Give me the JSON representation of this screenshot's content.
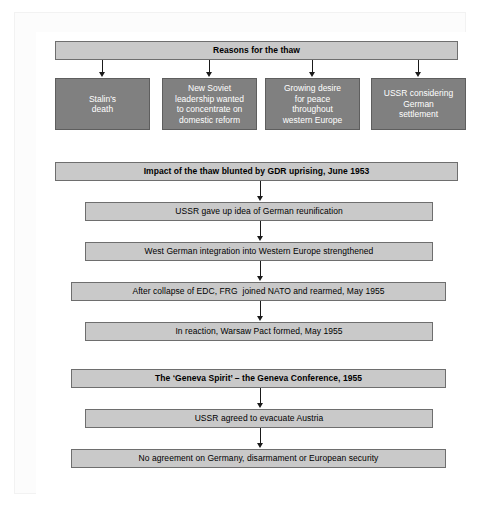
{
  "diagram": {
    "title_bar": {
      "label": "Reasons for the thaw"
    },
    "reasons": [
      {
        "label": "Stalin's\ndeath"
      },
      {
        "label": "New Soviet\nleadership wanted\nto concentrate on\ndomestic reform"
      },
      {
        "label": "Growing desire\nfor peace\nthroughout\nwestern Europe"
      },
      {
        "label": "USSR considering\nGerman\nsettlement"
      }
    ],
    "impact_header": {
      "label": "Impact of the thaw blunted by GDR uprising, June 1953"
    },
    "impact_steps": [
      {
        "label": "USSR gave up idea of German reunification"
      },
      {
        "label": "West German integration into Western Europe strengthened"
      },
      {
        "label": "After collapse of EDC, FRG  joined NATO and rearmed, May 1955"
      },
      {
        "label": "In reaction, Warsaw Pact formed, May 1955"
      }
    ],
    "geneva_header": {
      "label": "The ‘Geneva Spirit’ – the Geneva Conference, 1955"
    },
    "geneva_steps": [
      {
        "label": "USSR agreed to evacuate Austria"
      },
      {
        "label": "No agreement on Germany, disarmament or European security"
      }
    ],
    "colors": {
      "banner_fill": "#c9c9c9",
      "banner_border": "#6e6e6e",
      "reason_fill": "#808080",
      "reason_text": "#ffffff",
      "connector": "#1a1a1a",
      "page_background": "#ffffff"
    }
  }
}
